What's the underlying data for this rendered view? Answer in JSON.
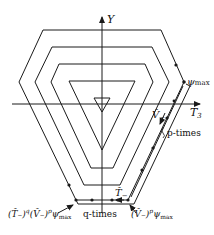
{
  "diagram": {
    "axes": {
      "vertical_label": "Y",
      "horizontal_label": "T",
      "horizontal_subscript": "3"
    },
    "labels": {
      "psi_max": "ψ",
      "psi_max_sub": "max",
      "v_minus": "V̂",
      "v_minus_sub": "−",
      "p_times": "p-times",
      "t_minus": "T̂",
      "t_minus_sub": "−",
      "q_times": "q-times",
      "bottom_left": "(T̂₋)",
      "bottom_left_q": "q",
      "bottom_left_v": "(V̂₋)",
      "bottom_left_p": "p",
      "bottom_left_psi": "ψ",
      "bottom_left_psi_sub": "max",
      "bottom_right_v": "(V̂₋)",
      "bottom_right_p": "p",
      "bottom_right_psi": "ψ",
      "bottom_right_psi_sub": "max"
    },
    "colors": {
      "line": "#1a1a1a",
      "background": "#ffffff"
    }
  }
}
